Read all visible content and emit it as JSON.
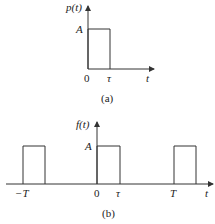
{
  "panel_a": {
    "y_label": "p(t)",
    "amplitude_label": "A",
    "origin_label": "0",
    "tau_label": "τ",
    "x_label": "t",
    "caption": "(a)"
  },
  "panel_b": {
    "y_label": "f(t)",
    "amplitude_label": "A",
    "neg_period_label": "−T",
    "origin_label": "0",
    "tau_label": "τ",
    "period_label": "T",
    "x_label": "t",
    "caption": "(b)"
  },
  "colors": {
    "stroke": "#333333",
    "text": "#222222"
  }
}
